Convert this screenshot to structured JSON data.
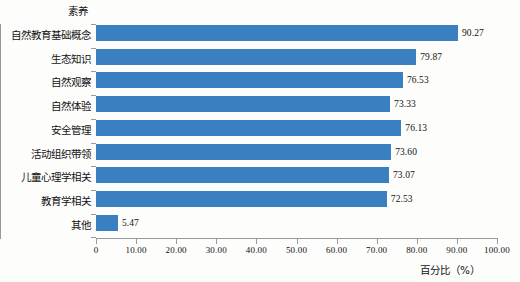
{
  "figure": {
    "y_axis_title": "素养",
    "x_axis_title": "百分比（%）",
    "bar_color": "#3a7fc0",
    "axis_color": "#9a9a9a",
    "background": "#fdfdfc"
  },
  "chart_data": {
    "type": "bar",
    "orientation": "horizontal",
    "title": "",
    "xlabel": "百分比（%）",
    "ylabel": "素养",
    "xlim": [
      0,
      100
    ],
    "grid": false,
    "legend": null,
    "categories": [
      "自然教育基础概念",
      "生态知识",
      "自然观察",
      "自然体验",
      "安全管理",
      "活动组织带领",
      "儿童心理学相关",
      "教育学相关",
      "其他"
    ],
    "values": [
      90.27,
      79.87,
      76.53,
      73.33,
      76.13,
      73.6,
      73.07,
      72.53,
      5.47
    ],
    "value_labels": [
      "90.27",
      "79.87",
      "76.53",
      "73.33",
      "76.13",
      "73.60",
      "73.07",
      "72.53",
      "5.47"
    ],
    "xticks": [
      0,
      10,
      20,
      30,
      40,
      50,
      60,
      70,
      80,
      90,
      100
    ],
    "xtick_labels": [
      "0",
      "10.00",
      "20.00",
      "30.00",
      "40.00",
      "50.00",
      "60.00",
      "70.00",
      "80.00",
      "90.00",
      "100.00"
    ]
  }
}
